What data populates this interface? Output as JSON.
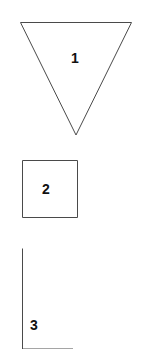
{
  "figure": {
    "background_color": "#ffffff",
    "stroke_color": "#4a4a4a",
    "label_color": "#111111",
    "width": 141,
    "height": 349
  },
  "shapes": [
    {
      "id": "shape-1",
      "kind": "triangle-inverted",
      "label": "1",
      "label_x": 75,
      "label_y": 58,
      "points": "20.5,22.5 131.5,22.5 76,135",
      "closed": true,
      "clipped": false
    },
    {
      "id": "shape-2",
      "kind": "square",
      "label": "2",
      "label_x": 46,
      "label_y": 189,
      "points": "22.5,160.5 77.5,160.5 77.5,217.5 22.5,217.5",
      "closed": true,
      "clipped": false
    },
    {
      "id": "shape-3",
      "kind": "triangle-right-clipped",
      "label": "3",
      "label_x": 34,
      "label_y": 325,
      "points": "22.5,248.5 22.5,349 73,349",
      "closed": false,
      "clipped": true
    }
  ]
}
